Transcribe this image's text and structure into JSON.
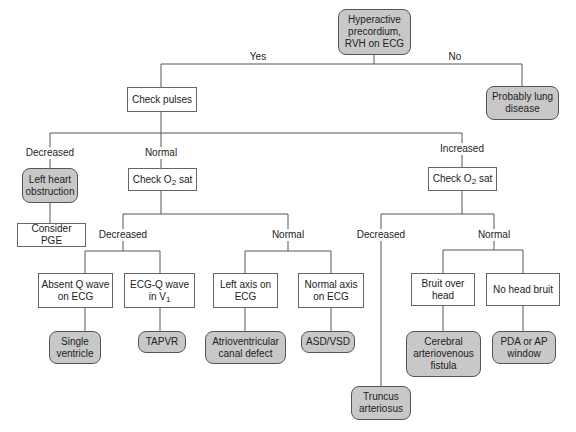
{
  "diagram": {
    "type": "flowchart",
    "nodes": {
      "root": "Hyperactive precordium, RVH on ECG",
      "check_pulses": "Check pulses",
      "lung": "Probably lung disease",
      "left_heart": "Left heart obstruction",
      "consider_pge": "Consider PGE",
      "check_o2_normal": {
        "pre": "Check O",
        "sub": "2",
        "post": " sat"
      },
      "check_o2_increased": {
        "pre": "Check O",
        "sub": "2",
        "post": " sat"
      },
      "absent_q": "Absent Q wave on ECG",
      "ecg_q": {
        "pre": "ECG-Q wave in V",
        "sub": "1"
      },
      "left_axis": "Left axis on ECG",
      "normal_axis": "Normal axis on ECG",
      "single_ventricle": "Single ventricle",
      "tapvr": "TAPVR",
      "av_canal": "Atrioventricular canal defect",
      "asd_vsd": "ASD/VSD",
      "bruit": "Bruit over head",
      "no_bruit": "No head bruit",
      "cerebral_avf": "Cerebral arteriovenous fistula",
      "pda": "PDA or AP window",
      "truncus": "Truncus arteriosus"
    },
    "edge_labels": {
      "yes": "Yes",
      "no": "No",
      "pulses_decreased": "Decreased",
      "pulses_normal": "Normal",
      "pulses_increased": "Increased",
      "o2a_decreased": "Decreased",
      "o2a_normal": "Normal",
      "o2b_decreased": "Decreased",
      "o2b_normal": "Normal"
    },
    "colors": {
      "terminal_fill": "#c8c8c8",
      "box_fill": "#ffffff",
      "line": "#555555"
    }
  }
}
